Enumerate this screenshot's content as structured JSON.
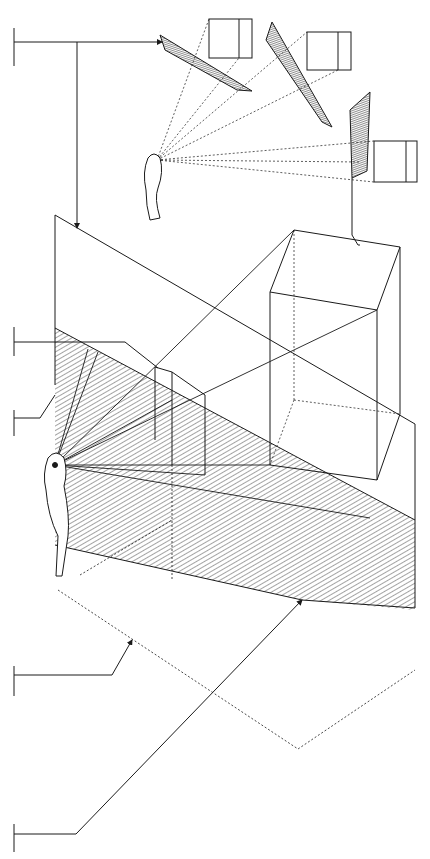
{
  "diagram": {
    "title": "",
    "width": 430,
    "height": 859,
    "background": "#ffffff",
    "ink": "#1a1a1a",
    "hatch_color": "#333333",
    "labels": [],
    "leaders": [
      {
        "id": "leader-top",
        "tick": [
          14,
          28,
          14,
          66
        ],
        "path": [
          [
            14,
            42
          ],
          [
            162,
            42
          ]
        ],
        "arrow": true
      },
      {
        "id": "leader-top-down",
        "path": [
          [
            77,
            42
          ],
          [
            77,
            228
          ]
        ],
        "arrow": true
      },
      {
        "id": "leader-mid-1",
        "tick": [
          14,
          327,
          14,
          356
        ],
        "path": [
          [
            14,
            342
          ],
          [
            125,
            342
          ],
          [
            158,
            368
          ]
        ],
        "arrow": false
      },
      {
        "id": "leader-mid-2",
        "tick": [
          14,
          410,
          14,
          436
        ],
        "path": [
          [
            14,
            418
          ],
          [
            40,
            418
          ],
          [
            55,
            395
          ]
        ],
        "arrow": false
      },
      {
        "id": "leader-low-1",
        "tick": [
          14,
          666,
          14,
          696
        ],
        "path": [
          [
            14,
            675
          ],
          [
            112,
            675
          ],
          [
            132,
            640
          ]
        ],
        "arrow": true
      },
      {
        "id": "leader-low-2",
        "tick": [
          14,
          824,
          14,
          852
        ],
        "path": [
          [
            14,
            834
          ],
          [
            76,
            834
          ],
          [
            302,
            600
          ]
        ],
        "arrow": true
      }
    ],
    "inset": {
      "planes": [
        {
          "id": "plane-1",
          "points": [
            [
              160,
              35
            ],
            [
              252,
              91
            ],
            [
              237,
              90
            ],
            [
              165,
              50
            ]
          ]
        },
        {
          "id": "plane-2",
          "points": [
            [
              272,
              22
            ],
            [
              332,
              127
            ],
            [
              322,
              122
            ],
            [
              266,
              40
            ]
          ]
        },
        {
          "id": "plane-3",
          "points": [
            [
              350,
              148
            ],
            [
              370,
              92
            ],
            [
              367,
              171
            ],
            [
              352,
              178
            ]
          ]
        }
      ],
      "cubes": [
        {
          "id": "cube-1",
          "x": 209,
          "y": 19,
          "w": 43,
          "h": 39,
          "split": 239
        },
        {
          "id": "cube-2",
          "x": 307,
          "y": 32,
          "w": 44,
          "h": 38,
          "split": 338
        },
        {
          "id": "cube-3",
          "x": 374,
          "y": 141,
          "w": 43,
          "h": 41,
          "split": 406
        }
      ],
      "eye": [
        157,
        160
      ]
    },
    "main": {
      "picture_plane": [
        [
          55,
          215
        ],
        [
          415,
          424
        ],
        [
          415,
          608
        ],
        [
          55,
          385
        ]
      ],
      "hatched_region": [
        [
          55,
          328
        ],
        [
          415,
          520
        ],
        [
          415,
          760
        ],
        [
          55,
          545
        ]
      ],
      "box_front": [
        [
          155,
          367
        ],
        [
          205,
          395
        ],
        [
          205,
          475
        ],
        [
          155,
          440
        ]
      ],
      "cube": {
        "top": [
          [
            294,
            230
          ],
          [
            400,
            247
          ],
          [
            377,
            310
          ],
          [
            270,
            292
          ]
        ],
        "bottom_front": [
          [
            270,
            465
          ],
          [
            377,
            480
          ]
        ],
        "back_bottom": [
          [
            294,
            400
          ],
          [
            400,
            414
          ]
        ]
      },
      "eye": [
        55,
        465
      ],
      "ground_points": [
        [
          65,
          593
        ],
        [
          302,
          600
        ],
        [
          415,
          670
        ],
        [
          298,
          749
        ],
        [
          131,
          640
        ]
      ]
    }
  }
}
